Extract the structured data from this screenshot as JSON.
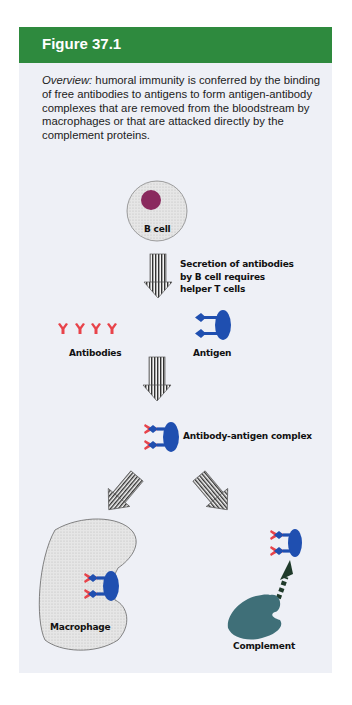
{
  "figure": {
    "title": "Figure 37.1",
    "overview_label": "Overview:",
    "overview_text": " humoral immunity is conferred by the binding of free antibodies to antigens to form antigen-antibody complexes that are removed from the bloodstream by macrophages or that are attacked directly by the complement proteins."
  },
  "diagram": {
    "b_cell_label": "B cell",
    "secretion_note": [
      "Secretion of antibodies",
      "by B cell requires",
      "helper T cells"
    ],
    "antibodies_label": "Antibodies",
    "antigen_label": "Antigen",
    "complex_label": "Antibody-antigen complex",
    "macrophage_label": "Macrophage",
    "complement_label": "Complement"
  },
  "colors": {
    "header_green": "#2e8a3e",
    "panel_bg": "#eef0f6",
    "antibody_red": "#e8434a",
    "antigen_blue": "#1f4fb0",
    "nucleus_purple": "#8a2a5e",
    "complement_teal": "#3f6f78"
  }
}
